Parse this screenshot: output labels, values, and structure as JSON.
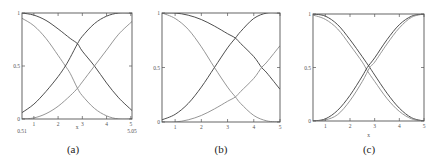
{
  "chart_data": [
    {
      "type": "line",
      "caption": "(a)",
      "xlabel": "x",
      "ylabel": "",
      "xlim": [
        0.51,
        5.05
      ],
      "ylim": [
        0,
        1
      ],
      "xticks": [
        1,
        2,
        3,
        4,
        5
      ],
      "xtick_labels": [
        "1",
        "2",
        "3",
        "4",
        "5"
      ],
      "extra_x_labels": [
        {
          "value": 0.51,
          "label": "0.51"
        },
        {
          "value": 5.05,
          "label": "5.05"
        }
      ],
      "yticks": [
        0,
        0.5,
        1
      ],
      "ytick_labels": [
        "0",
        "0.5",
        "1"
      ],
      "grid": false,
      "series": [
        {
          "name": "decreasing-dark",
          "color": "#3a3a3a",
          "x": [
            0.51,
            1.0,
            1.5,
            2.0,
            2.5,
            2.8,
            3.0,
            3.5,
            4.0,
            4.5,
            5.05
          ],
          "y": [
            1.0,
            0.98,
            0.93,
            0.85,
            0.76,
            0.71,
            0.64,
            0.5,
            0.34,
            0.2,
            0.08
          ]
        },
        {
          "name": "decreasing-light",
          "color": "#8a8a8a",
          "x": [
            0.51,
            1.0,
            1.5,
            2.0,
            2.3,
            2.5,
            2.8,
            3.0,
            3.5,
            4.0,
            4.5,
            5.05
          ],
          "y": [
            0.95,
            0.88,
            0.76,
            0.6,
            0.5,
            0.43,
            0.29,
            0.22,
            0.1,
            0.03,
            0.0,
            0.0
          ]
        },
        {
          "name": "increasing-dark",
          "color": "#3a3a3a",
          "x": [
            0.51,
            1.0,
            1.5,
            2.0,
            2.3,
            2.5,
            2.8,
            3.0,
            3.5,
            4.0,
            4.5,
            5.05
          ],
          "y": [
            0.06,
            0.14,
            0.26,
            0.4,
            0.5,
            0.58,
            0.71,
            0.78,
            0.9,
            0.97,
            1.0,
            1.0
          ]
        },
        {
          "name": "increasing-light",
          "color": "#8a8a8a",
          "x": [
            0.51,
            1.0,
            1.5,
            2.0,
            2.5,
            2.8,
            3.0,
            3.5,
            4.0,
            4.5,
            5.05
          ],
          "y": [
            0.0,
            0.01,
            0.05,
            0.12,
            0.22,
            0.29,
            0.35,
            0.5,
            0.65,
            0.8,
            0.92
          ]
        }
      ]
    },
    {
      "type": "line",
      "caption": "(b)",
      "xlabel": "",
      "ylabel": "",
      "xlim": [
        0.5,
        5
      ],
      "ylim": [
        0,
        1
      ],
      "xticks": [
        1,
        2,
        3,
        4,
        5
      ],
      "xtick_labels": [
        "1",
        "2",
        "3",
        "4",
        "5"
      ],
      "yticks": [
        0,
        0.5,
        1
      ],
      "ytick_labels": [
        "0",
        "0.5",
        "1"
      ],
      "grid": false,
      "series": [
        {
          "name": "decreasing-dark",
          "color": "#3a3a3a",
          "x": [
            0.5,
            1.0,
            1.5,
            2.0,
            2.5,
            3.0,
            3.3,
            3.5,
            4.0,
            4.3,
            4.5,
            5.0
          ],
          "y": [
            1.0,
            1.0,
            0.98,
            0.94,
            0.88,
            0.81,
            0.77,
            0.72,
            0.6,
            0.5,
            0.45,
            0.3
          ]
        },
        {
          "name": "decreasing-light",
          "color": "#8a8a8a",
          "x": [
            0.5,
            1.0,
            1.5,
            2.0,
            2.5,
            3.0,
            3.3,
            3.5,
            4.0,
            4.5,
            5.0
          ],
          "y": [
            1.0,
            0.95,
            0.85,
            0.69,
            0.5,
            0.32,
            0.23,
            0.17,
            0.06,
            0.01,
            0.0
          ]
        },
        {
          "name": "increasing-dark",
          "color": "#3a3a3a",
          "x": [
            0.5,
            1.0,
            1.5,
            2.0,
            2.5,
            3.0,
            3.3,
            3.5,
            4.0,
            4.5,
            5.0
          ],
          "y": [
            0.02,
            0.07,
            0.17,
            0.32,
            0.5,
            0.68,
            0.77,
            0.83,
            0.95,
            1.0,
            1.0
          ]
        },
        {
          "name": "increasing-light",
          "color": "#8a8a8a",
          "x": [
            0.5,
            1.0,
            1.5,
            2.0,
            2.5,
            3.0,
            3.3,
            3.5,
            4.0,
            4.3,
            4.5,
            5.0
          ],
          "y": [
            0.0,
            0.0,
            0.02,
            0.06,
            0.12,
            0.19,
            0.23,
            0.28,
            0.4,
            0.5,
            0.55,
            0.7
          ]
        }
      ]
    },
    {
      "type": "line",
      "caption": "(c)",
      "xlabel": "x",
      "ylabel": "",
      "xlim": [
        0.5,
        5
      ],
      "ylim": [
        0,
        1
      ],
      "xticks": [
        1,
        2,
        3,
        4,
        5
      ],
      "xtick_labels": [
        "1",
        "2",
        "3",
        "4",
        "5"
      ],
      "yticks": [
        0,
        0.5,
        1
      ],
      "ytick_labels": [
        "0",
        "0.5",
        "1"
      ],
      "grid": false,
      "series": [
        {
          "name": "decreasing-dark",
          "color": "#3a3a3a",
          "x": [
            0.5,
            1.0,
            1.5,
            2.0,
            2.5,
            2.8,
            3.0,
            3.5,
            4.0,
            4.5,
            5.0
          ],
          "y": [
            1.0,
            0.98,
            0.9,
            0.76,
            0.6,
            0.5,
            0.43,
            0.26,
            0.12,
            0.03,
            0.0
          ]
        },
        {
          "name": "decreasing-light",
          "color": "#8a8a8a",
          "x": [
            0.5,
            1.0,
            1.5,
            2.0,
            2.5,
            2.7,
            3.0,
            3.5,
            4.0,
            4.5,
            5.0
          ],
          "y": [
            0.99,
            0.95,
            0.86,
            0.71,
            0.55,
            0.47,
            0.37,
            0.21,
            0.09,
            0.02,
            0.0
          ]
        },
        {
          "name": "increasing-dark",
          "color": "#3a3a3a",
          "x": [
            0.5,
            1.0,
            1.5,
            2.0,
            2.5,
            2.7,
            3.0,
            3.5,
            4.0,
            4.5,
            5.0
          ],
          "y": [
            0.0,
            0.02,
            0.1,
            0.24,
            0.42,
            0.5,
            0.59,
            0.76,
            0.9,
            0.98,
            1.0
          ]
        },
        {
          "name": "increasing-light",
          "color": "#8a8a8a",
          "x": [
            0.5,
            1.0,
            1.5,
            2.0,
            2.5,
            2.8,
            3.0,
            3.5,
            4.0,
            4.5,
            5.0
          ],
          "y": [
            0.0,
            0.01,
            0.06,
            0.19,
            0.37,
            0.5,
            0.55,
            0.72,
            0.87,
            0.97,
            1.0
          ]
        }
      ]
    }
  ]
}
